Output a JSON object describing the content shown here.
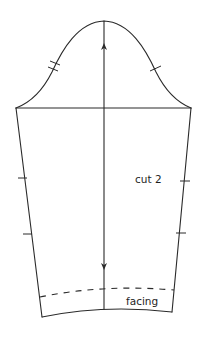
{
  "diagram": {
    "type": "sewing-pattern-piece",
    "piece": "sleeve",
    "labels": {
      "cut_instruction": "cut 2",
      "facing_label": "facing"
    },
    "markings": {
      "grainline": "double-headed arrow, vertical center",
      "front_notch": "single notch on right cap",
      "back_notch": "double notch on left cap",
      "side_seam_notches": 4,
      "hem_fold_line": "dashed"
    },
    "colors": {
      "line": "#2a2a2a",
      "background": "#ffffff"
    }
  }
}
